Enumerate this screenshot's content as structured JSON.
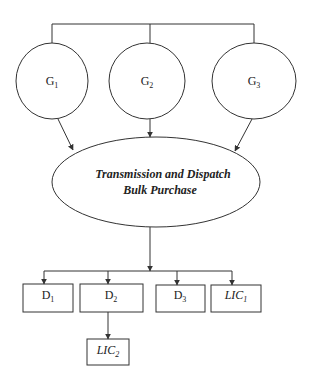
{
  "generators": [
    {
      "label": "G",
      "sub": "1"
    },
    {
      "label": "G",
      "sub": "2"
    },
    {
      "label": "G",
      "sub": "3"
    }
  ],
  "center": {
    "line1": "Transmission and Dispatch",
    "line2": "Bulk Purchase"
  },
  "outputs": [
    {
      "label": "D",
      "sub": "1"
    },
    {
      "label": "D",
      "sub": "2"
    },
    {
      "label": "D",
      "sub": "3"
    },
    {
      "label": "LIC",
      "sub": "1"
    }
  ],
  "sub_output": {
    "label": "LIC",
    "sub": "2"
  },
  "colors": {
    "stroke": "#333333",
    "background": "#ffffff"
  }
}
